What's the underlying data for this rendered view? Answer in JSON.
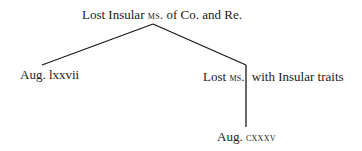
{
  "diagram": {
    "type": "stemma-codicum",
    "nodes": [
      {
        "id": "root",
        "parts": {
          "pre": "Lost Insular ",
          "sc": "ms.",
          "post": " of Co. and Re."
        }
      },
      {
        "id": "left-leaf",
        "label": "Aug. lxxvii"
      },
      {
        "id": "mid-node",
        "parts": {
          "pre": "Lost ",
          "sc": "ms.",
          "post": "with Insular traits"
        }
      },
      {
        "id": "bottom-leaf",
        "parts": {
          "pre": "Aug. ",
          "sc": "cxxxv"
        }
      }
    ],
    "edges": [
      {
        "from": "root",
        "to": "left-leaf"
      },
      {
        "from": "root",
        "to": "mid-node"
      },
      {
        "from": "mid-node",
        "to": "bottom-leaf"
      }
    ],
    "line_color": "#1a1a1a"
  }
}
